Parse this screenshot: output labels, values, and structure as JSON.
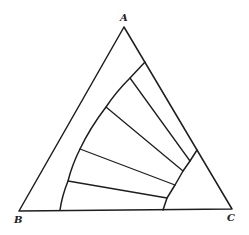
{
  "diagram": {
    "type": "ternary-phase-diagram",
    "vertices": [
      {
        "label": "A",
        "x": 124,
        "y": 27,
        "label_x": 120,
        "label_y": 21
      },
      {
        "label": "B",
        "x": 19,
        "y": 211,
        "label_x": 14,
        "label_y": 223
      },
      {
        "label": "C",
        "x": 232,
        "y": 209,
        "label_x": 227,
        "label_y": 221
      }
    ],
    "left_boundary_curve": "M145,62 L130,78 Q116,92 106,107 Q90,128 80,149 Q72,165 68,181 Q62,196 60,210",
    "right_boundary_curve": "M197,150 L190,161 L183,171 L175,185 L167,198 L163,210",
    "tie_lines": [
      {
        "x1": 130,
        "y1": 78,
        "x2": 190,
        "y2": 161
      },
      {
        "x1": 106,
        "y1": 107,
        "x2": 183,
        "y2": 171
      },
      {
        "x1": 80,
        "y1": 149,
        "x2": 175,
        "y2": 185
      },
      {
        "x1": 68,
        "y1": 181,
        "x2": 167,
        "y2": 198
      }
    ],
    "stroke_color": "#1e1e1e",
    "background": "#ffffff"
  }
}
